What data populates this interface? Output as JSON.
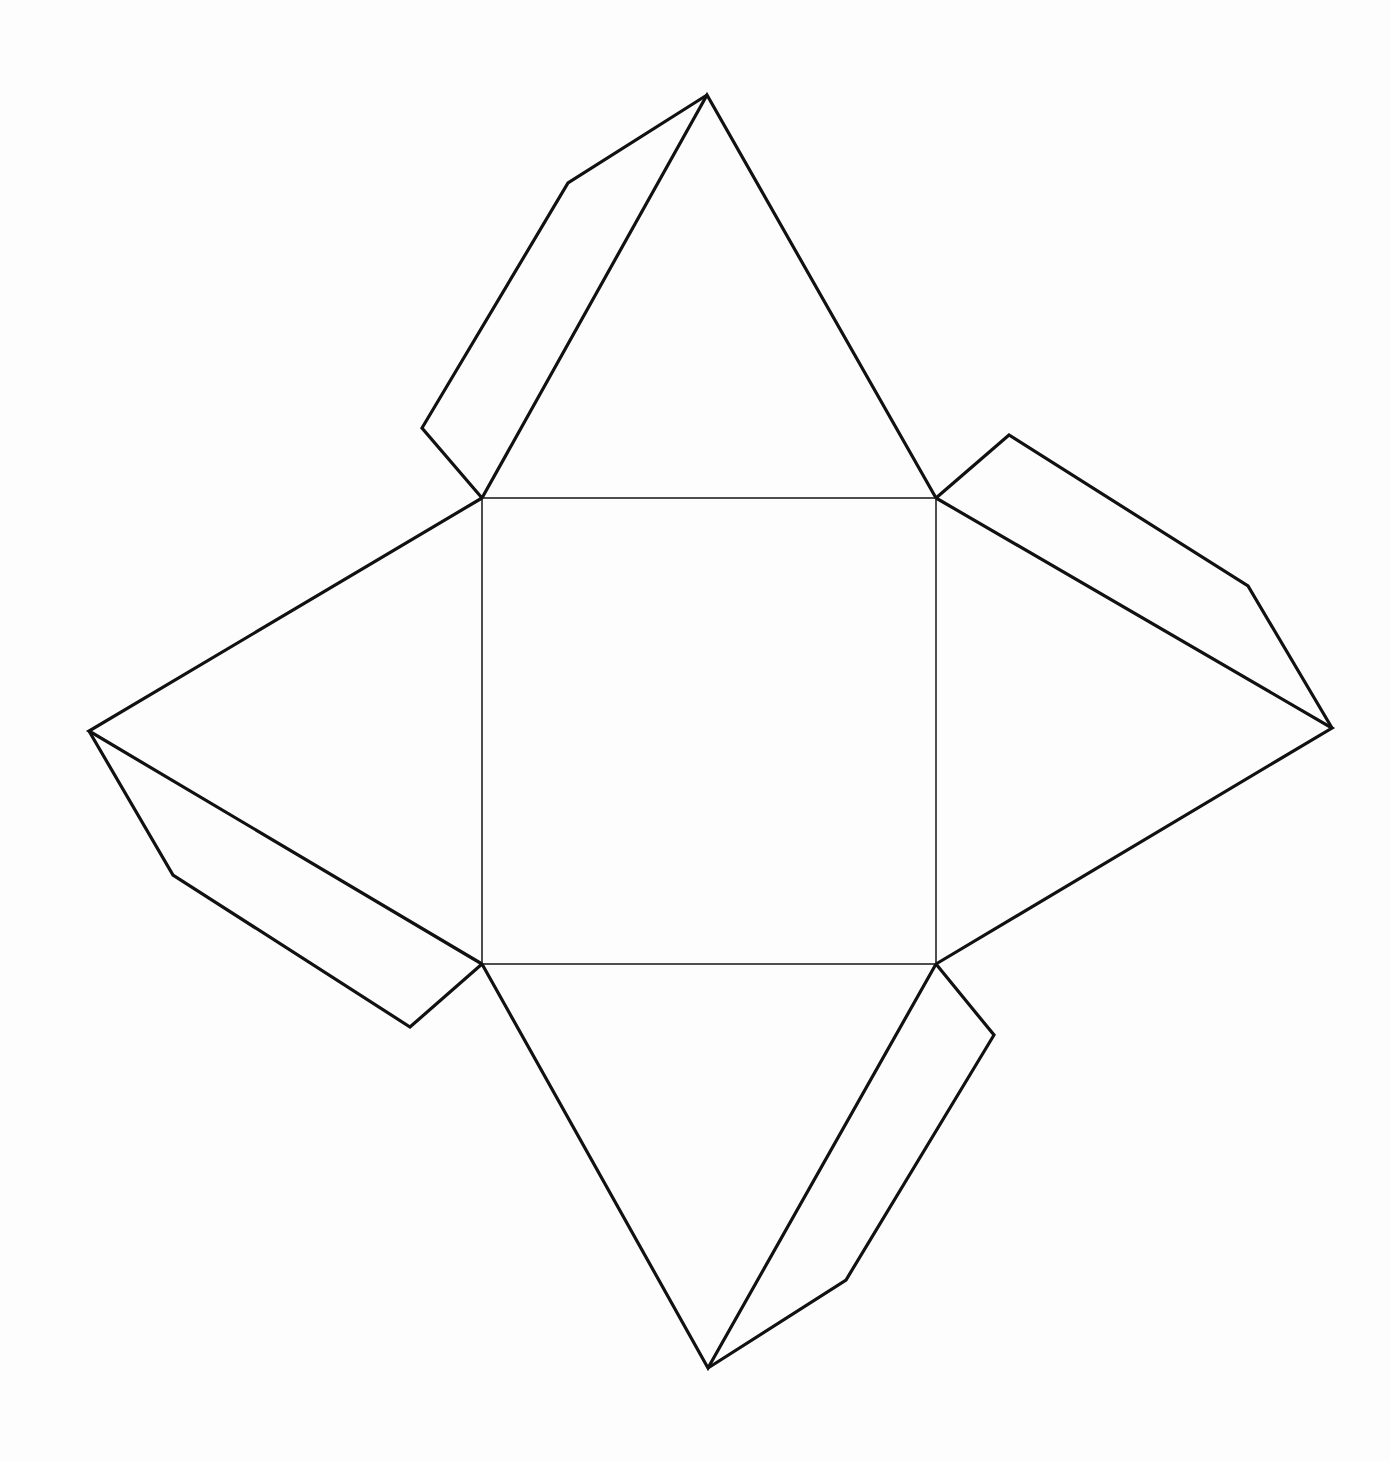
{
  "diagram": {
    "type": "square-pyramid-net-with-glue-tabs",
    "colors": {
      "background": "#fdfdfd",
      "stroke": "#111111"
    },
    "base_square": {
      "tl": [
        482,
        498
      ],
      "tr": [
        936,
        498
      ],
      "br": [
        936,
        964
      ],
      "bl": [
        482,
        964
      ]
    },
    "faces": [
      {
        "name": "top-face",
        "points": "482,498 707,95 936,498"
      },
      {
        "name": "right-face",
        "points": "936,498 1332,728 936,964"
      },
      {
        "name": "bottom-face",
        "points": "936,964 708,1368 482,964"
      },
      {
        "name": "left-face",
        "points": "482,964 89,731 482,498"
      }
    ],
    "tabs": [
      {
        "name": "top-glue-tab",
        "points": "707,95 568,183 422,428 482,498"
      },
      {
        "name": "right-glue-tab",
        "points": "936,498 1009,435 1248,586 1332,728"
      },
      {
        "name": "bottom-glue-tab",
        "points": "936,964 994,1035 846,1280 708,1368"
      },
      {
        "name": "left-glue-tab",
        "points": "89,731 173,875 410,1027 482,964"
      }
    ]
  }
}
